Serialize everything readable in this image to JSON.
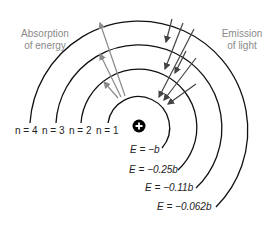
{
  "diagram": {
    "nucleus": {
      "symbol": "+",
      "color": "#000000"
    },
    "levels": [
      {
        "n": 1,
        "label": "n = 1",
        "energy": "E = −b"
      },
      {
        "n": 2,
        "label": "n = 2",
        "energy": "E = −0.25b"
      },
      {
        "n": 3,
        "label": "n = 3",
        "energy": "E = −0.11b"
      },
      {
        "n": 4,
        "label": "n = 4",
        "energy": "E = −0.062b"
      }
    ],
    "absorption": {
      "line1": "Absorption",
      "line2": "of energy",
      "color": "#8a8a8a",
      "transitions": [
        "1→2",
        "1→3",
        "1→4"
      ]
    },
    "emission": {
      "line1": "Emission",
      "line2": "of light",
      "color": "#333333",
      "transitions": [
        "4→3",
        "4→2",
        "4→1",
        "3→2",
        "3→1",
        "2→1"
      ]
    },
    "colors": {
      "orbit": "#111111",
      "absorption_arrow": "#8a8a8a",
      "emission_arrow": "#444444"
    }
  }
}
